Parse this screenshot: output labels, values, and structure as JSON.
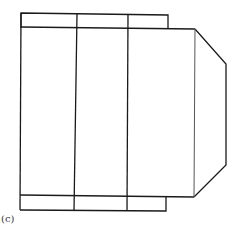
{
  "figure": {
    "label": "(c)",
    "stroke_color": "#1a1a1a",
    "background": "#ffffff"
  }
}
